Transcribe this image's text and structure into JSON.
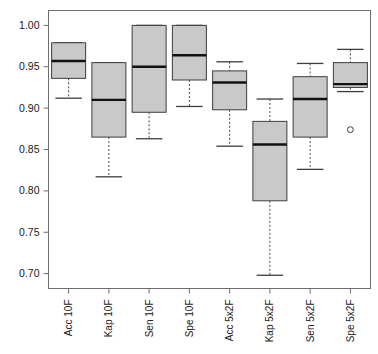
{
  "chart_data": {
    "type": "box",
    "title": "",
    "xlabel": "",
    "ylabel": "",
    "ylim": [
      0.682,
      1.018
    ],
    "grid": false,
    "legend": null,
    "yticks": [
      "0.70",
      "0.75",
      "0.80",
      "0.85",
      "0.90",
      "0.95",
      "1.00"
    ],
    "ytick_values": [
      0.7,
      0.75,
      0.8,
      0.85,
      0.9,
      0.95,
      1.0
    ],
    "categories": [
      "Acc 10F",
      "Kap 10F",
      "Sen 10F",
      "Spe 10F",
      "Acc 5x2F",
      "Kap 5x2F",
      "Sen 5x2F",
      "Spe 5x2F"
    ],
    "boxes": [
      {
        "label": "Acc 10F",
        "whisker_low": 0.912,
        "q1": 0.936,
        "median": 0.957,
        "q3": 0.979,
        "whisker_high": 0.979,
        "outliers": []
      },
      {
        "label": "Kap 10F",
        "whisker_low": 0.817,
        "q1": 0.865,
        "median": 0.91,
        "q3": 0.955,
        "whisker_high": 0.955,
        "outliers": []
      },
      {
        "label": "Sen 10F",
        "whisker_low": 0.863,
        "q1": 0.895,
        "median": 0.95,
        "q3": 1.0,
        "whisker_high": 1.0,
        "outliers": []
      },
      {
        "label": "Spe 10F",
        "whisker_low": 0.902,
        "q1": 0.934,
        "median": 0.964,
        "q3": 1.0,
        "whisker_high": 1.0,
        "outliers": []
      },
      {
        "label": "Acc 5x2F",
        "whisker_low": 0.854,
        "q1": 0.898,
        "median": 0.931,
        "q3": 0.945,
        "whisker_high": 0.956,
        "outliers": []
      },
      {
        "label": "Kap 5x2F",
        "whisker_low": 0.698,
        "q1": 0.788,
        "median": 0.856,
        "q3": 0.884,
        "whisker_high": 0.911,
        "outliers": []
      },
      {
        "label": "Sen 5x2F",
        "whisker_low": 0.826,
        "q1": 0.865,
        "median": 0.911,
        "q3": 0.938,
        "whisker_high": 0.954,
        "outliers": []
      },
      {
        "label": "Spe 5x2F",
        "whisker_low": 0.92,
        "q1": 0.925,
        "median": 0.929,
        "q3": 0.955,
        "whisker_high": 0.971,
        "outliers": [
          0.874
        ]
      }
    ],
    "colors": {
      "box_fill": "#c9c9c9",
      "box_border": "#3d3d3d",
      "median": "#111111",
      "whisker": "#4a4a4a",
      "axis": "#6e6e6e",
      "background": "#ffffff",
      "outlier_stroke": "#3d3d3d"
    }
  }
}
